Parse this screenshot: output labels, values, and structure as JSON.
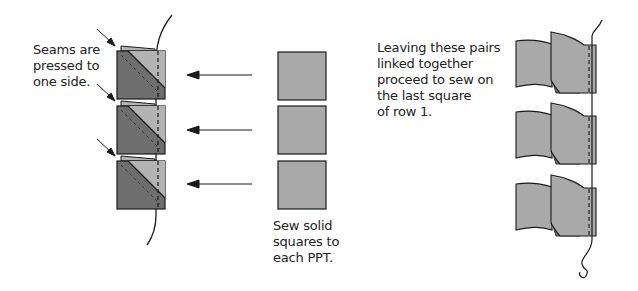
{
  "labels": {
    "seams": {
      "lines": [
        "Seams are",
        "pressed to",
        "one side."
      ]
    },
    "sew_solid": {
      "lines": [
        "Sew solid",
        "squares to",
        "each PPT."
      ]
    },
    "leaving": {
      "lines": [
        "Leaving these pairs",
        "linked together",
        "proceed to sew on",
        "the last square",
        "of row 1."
      ]
    }
  },
  "colors": {
    "dark_triangle": "#6e6e6e",
    "light_triangle": "#b3b3b3",
    "solid_square": "#a9a9a9",
    "outline": "#1a1a1a"
  },
  "figures": {
    "ppt_stack_count": 3,
    "solid_square_count": 3,
    "arrow_count": 3,
    "linked_pairs_count": 3
  }
}
